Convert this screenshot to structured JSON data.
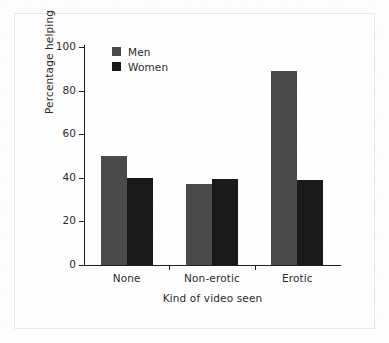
{
  "chart_data": {
    "type": "bar",
    "title": "",
    "xlabel": "Kind of video seen",
    "ylabel": "Percentage helping",
    "categories": [
      "None",
      "Non-erotic",
      "Erotic"
    ],
    "series": [
      {
        "name": "Men",
        "color": "#4a4a4a",
        "values": [
          50,
          37,
          89
        ]
      },
      {
        "name": "Women",
        "color": "#1a1a1a",
        "values": [
          40,
          39.5,
          39
        ]
      }
    ],
    "ylim": [
      0,
      100
    ],
    "yticks": [
      0,
      20,
      40,
      60,
      80,
      100
    ],
    "ytick_labels": [
      "0",
      "20",
      "40",
      "60",
      "80",
      "100"
    ],
    "grid": false,
    "legend_position": "top-left-inside",
    "legend_entries": [
      "Men",
      "Women"
    ]
  },
  "axes": {
    "y_title": "Percentage helping",
    "x_title": "Kind of video seen",
    "y_tick_labels": [
      "100",
      "80",
      "60",
      "40",
      "20",
      "0"
    ],
    "x_tick_labels": [
      "None",
      "Non-erotic",
      "Erotic"
    ]
  },
  "legend": {
    "men_label": "Men",
    "women_label": "Women"
  }
}
